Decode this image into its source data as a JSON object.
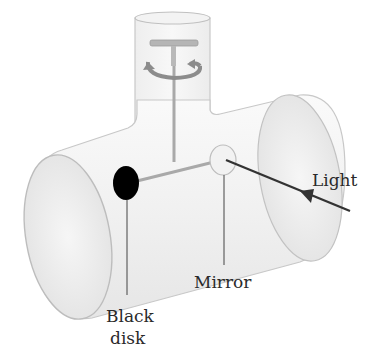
{
  "diagram": {
    "type": "apparatus-illustration",
    "components": [
      "vertical glass tube",
      "horizontal glass tube",
      "T-shaped suspension rod",
      "rotation arrows",
      "black disk",
      "mirror",
      "incoming light ray"
    ],
    "labels": {
      "light": "Light",
      "mirror": "Mirror",
      "black_disk_line1": "Black",
      "black_disk_line2": "disk"
    },
    "colors": {
      "tube_outline": "#c8c8c8",
      "tube_fill": "#f4f4f4",
      "rod": "#a9a9a9",
      "disk": "#000000",
      "arrow": "#333333",
      "text": "#2a2a2a"
    }
  }
}
